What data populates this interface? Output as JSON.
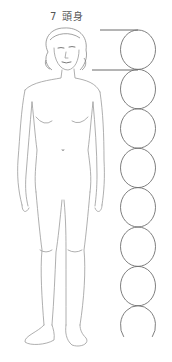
{
  "diagram": {
    "title": "7 頭身",
    "head_units": 7,
    "circle_count": 8,
    "last_circle_open": true,
    "colors": {
      "background": "#ffffff",
      "line": "#6f6f6f",
      "sketch": "#9a9a9a",
      "text": "#555555"
    }
  }
}
